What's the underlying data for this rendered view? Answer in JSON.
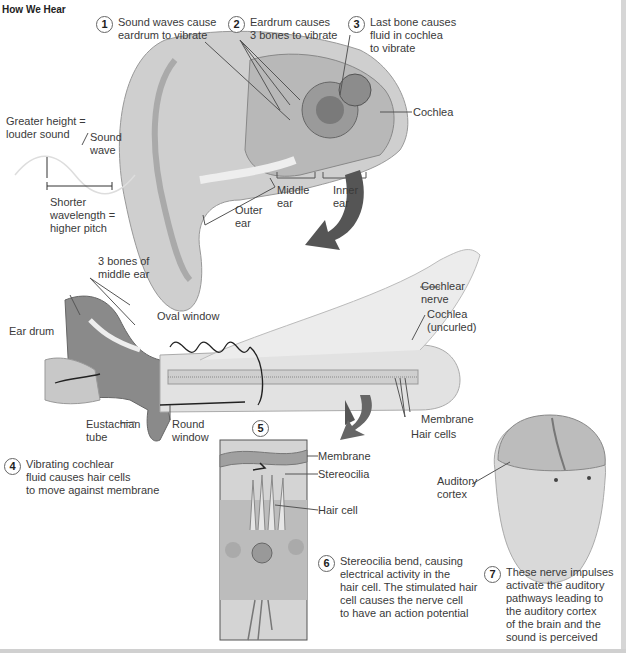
{
  "title": "How We Hear",
  "steps": [
    {
      "num": "1",
      "text": "Sound waves cause\neardrum to vibrate"
    },
    {
      "num": "2",
      "text": "Eardrum causes\n3 bones to vibrate"
    },
    {
      "num": "3",
      "text": "Last bone causes\nfluid in cochlea\nto vibrate"
    },
    {
      "num": "4",
      "text": "Vibrating cochlear\nfluid causes hair cells\nto move against membrane"
    },
    {
      "num": "5",
      "text": ""
    },
    {
      "num": "6",
      "text": "Stereocilia bend, causing\nelectrical activity in the\nhair cell. The stimulated hair\ncell causes the nerve cell\nto have an action potential"
    },
    {
      "num": "7",
      "text": "These nerve impulses\nactivate the auditory\npathways leading to\nthe auditory cortex\nof the brain and the\nsound is perceived"
    }
  ],
  "labels": {
    "greater_height": "Greater height =\nlouder sound",
    "sound_wave": "Sound\nwave",
    "shorter_wavelength": "Shorter\nwavelength =\nhigher pitch",
    "cochlea": "Cochlea",
    "outer_ear": "Outer\near",
    "middle_ear": "Middle\near",
    "inner_ear": "Inner\near",
    "three_bones": "3 bones of\nmiddle ear",
    "ear_drum": "Ear drum",
    "oval_window": "Oval window",
    "cochlear_nerve": "Cochlear\nnerve",
    "cochlea_uncurled": "Cochlea\n(uncurled)",
    "eustachian_tube": "Eustachian\ntube",
    "round_window": "Round\nwindow",
    "membrane_main": "Membrane",
    "hair_cells": "Hair cells",
    "membrane_inset": "Membrane",
    "stereocilia": "Stereocilia",
    "hair_cell": "Hair cell",
    "auditory_cortex": "Auditory\ncortex"
  }
}
